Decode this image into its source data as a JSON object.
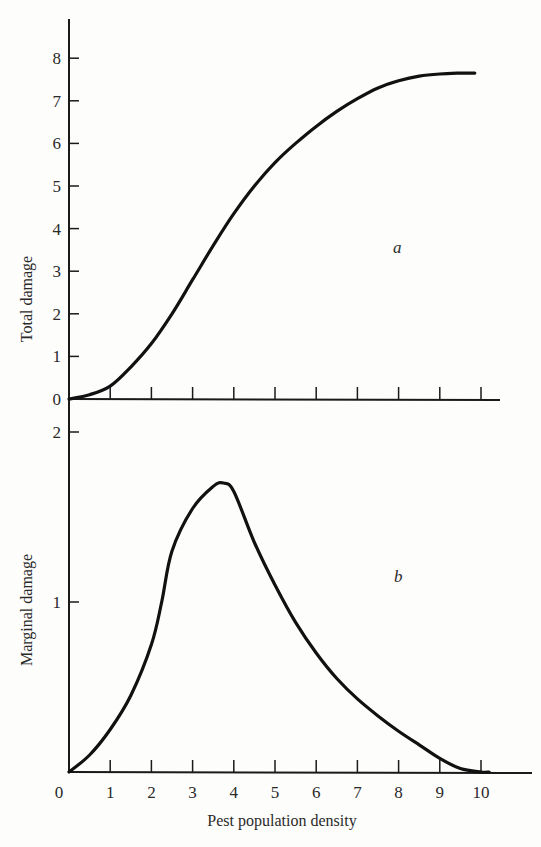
{
  "chart_data": [
    {
      "panel": "a",
      "type": "line",
      "title": "",
      "xlabel": "",
      "ylabel": "Total damage",
      "xlim": [
        0,
        11
      ],
      "ylim": [
        0,
        8.5
      ],
      "yticks": [
        0,
        1,
        2,
        3,
        4,
        5,
        6,
        7,
        8
      ],
      "xticks": [
        1,
        2,
        3,
        4,
        5,
        6,
        7,
        8,
        9,
        10
      ],
      "grid": false,
      "annotation": "a",
      "series": [
        {
          "name": "Total damage",
          "x": [
            0,
            0.5,
            1,
            1.5,
            2,
            2.5,
            3,
            3.5,
            4,
            4.5,
            5,
            5.5,
            6,
            6.5,
            7,
            7.5,
            8,
            8.5,
            9,
            9.5,
            9.85
          ],
          "y": [
            0,
            0.1,
            0.3,
            0.75,
            1.3,
            2.0,
            2.8,
            3.6,
            4.35,
            5.0,
            5.55,
            6.0,
            6.4,
            6.75,
            7.05,
            7.3,
            7.47,
            7.58,
            7.63,
            7.65,
            7.65
          ]
        }
      ]
    },
    {
      "panel": "b",
      "type": "line",
      "title": "",
      "xlabel": "Pest population density",
      "ylabel": "Marginal damage",
      "xlim": [
        0,
        11
      ],
      "ylim": [
        0,
        2.2
      ],
      "yticks": [
        1,
        2
      ],
      "xticks": [
        0,
        1,
        2,
        3,
        4,
        5,
        6,
        7,
        8,
        9,
        10
      ],
      "grid": false,
      "annotation": "b",
      "series": [
        {
          "name": "Marginal damage",
          "x": [
            0,
            0.5,
            1,
            1.5,
            2,
            2.25,
            2.5,
            3,
            3.5,
            3.75,
            4,
            4.5,
            5,
            5.5,
            6,
            6.5,
            7,
            7.5,
            8,
            8.5,
            9,
            9.5,
            10,
            10.2
          ],
          "y": [
            0,
            0.1,
            0.25,
            0.45,
            0.75,
            1.0,
            1.3,
            1.55,
            1.68,
            1.7,
            1.65,
            1.35,
            1.1,
            0.88,
            0.7,
            0.55,
            0.43,
            0.33,
            0.24,
            0.16,
            0.08,
            0.02,
            0,
            0
          ]
        }
      ]
    }
  ],
  "labels": {
    "top_ylabel": "Total damage",
    "bottom_ylabel": "Marginal damage",
    "xlabel": "Pest population density",
    "panel_a": "a",
    "panel_b": "b"
  }
}
